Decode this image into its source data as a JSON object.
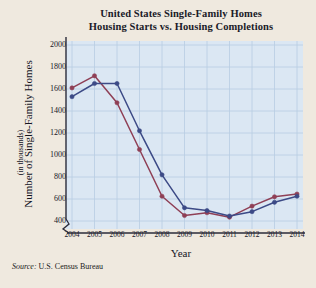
{
  "chart_data": {
    "type": "line",
    "title": "United States Single-Family Homes",
    "subtitle": "Housing Starts vs. Housing Completions",
    "xlabel": "Year",
    "ylabel": "Number of Single-Family Homes",
    "ylabel_sub": "(in thousands)",
    "categories": [
      2004,
      2005,
      2006,
      2007,
      2008,
      2009,
      2010,
      2011,
      2012,
      2013,
      2014
    ],
    "xtick_labels": [
      "2004",
      "2005",
      "2006",
      "2007",
      "2008",
      "2009",
      "2010",
      "2011",
      "2012",
      "2013",
      "2014"
    ],
    "ytick_labels": [
      "2000",
      "1800",
      "1600",
      "1400",
      "1200",
      "1000",
      "800",
      "600",
      "400"
    ],
    "ytick_values": [
      2000,
      1800,
      1600,
      1400,
      1200,
      1000,
      800,
      600,
      400
    ],
    "ylim": [
      400,
      2000
    ],
    "axis_break": true,
    "grid": true,
    "legend_position": "inline-annotation",
    "series": [
      {
        "name": "Started",
        "color": "#8f3f55",
        "marker": "circle",
        "values": [
          1610,
          1720,
          1475,
          1050,
          625,
          450,
          475,
          435,
          535,
          620,
          645
        ]
      },
      {
        "name": "Completed",
        "color": "#3c4a86",
        "marker": "circle",
        "values": [
          1530,
          1650,
          1650,
          1220,
          820,
          520,
          495,
          445,
          485,
          570,
          625
        ]
      }
    ],
    "annotations": [
      {
        "text": "Completed",
        "x": 2007,
        "y": 1430
      },
      {
        "text": "Started",
        "x": 2006.2,
        "y": 1100
      }
    ],
    "source": "U.S. Census Bureau",
    "source_prefix": "Source:",
    "plot_bg": "#dbe7f3",
    "grid_color": "#b8cde2",
    "page_bg": "#efe9df"
  }
}
